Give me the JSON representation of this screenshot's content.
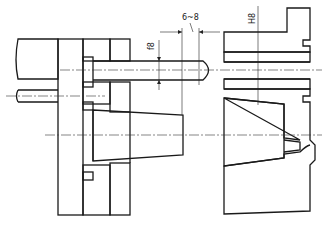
{
  "figure": {
    "type": "mechanical section drawing",
    "dimensions": [
      {
        "id": "pin_fit",
        "text": "f8",
        "orientation": "vertical"
      },
      {
        "id": "gap",
        "text": "6~8",
        "orientation": "horizontal"
      },
      {
        "id": "bushing_fit",
        "text": "H8",
        "orientation": "vertical"
      }
    ],
    "colors": {
      "line": "#1a1a1a",
      "background": "#ffffff"
    }
  }
}
